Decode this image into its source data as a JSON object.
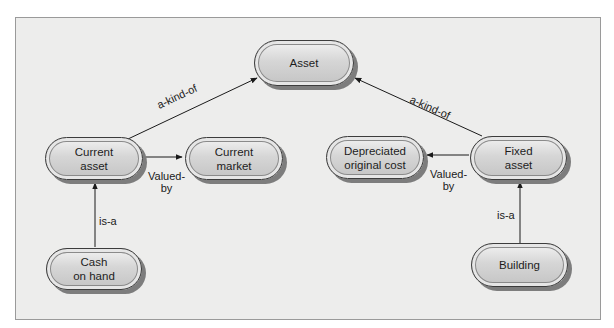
{
  "diagram": {
    "type": "semantic-network",
    "nodes": {
      "asset": "Asset",
      "current_asset": "Current\nasset",
      "current_market": "Current\nmarket",
      "depreciated_original_cost": "Depreciated\noriginal cost",
      "fixed_asset": "Fixed\nasset",
      "cash_on_hand": "Cash\non hand",
      "building": "Building"
    },
    "edges": [
      {
        "from": "current_asset",
        "to": "asset",
        "label": "a-kind-of"
      },
      {
        "from": "fixed_asset",
        "to": "asset",
        "label": "a-kind-of"
      },
      {
        "from": "current_asset",
        "to": "current_market",
        "label": "Valued-\nby"
      },
      {
        "from": "fixed_asset",
        "to": "depreciated_original_cost",
        "label": "Valued-\nby"
      },
      {
        "from": "cash_on_hand",
        "to": "current_asset",
        "label": "is-a"
      },
      {
        "from": "building",
        "to": "fixed_asset",
        "label": "is-a"
      }
    ]
  }
}
